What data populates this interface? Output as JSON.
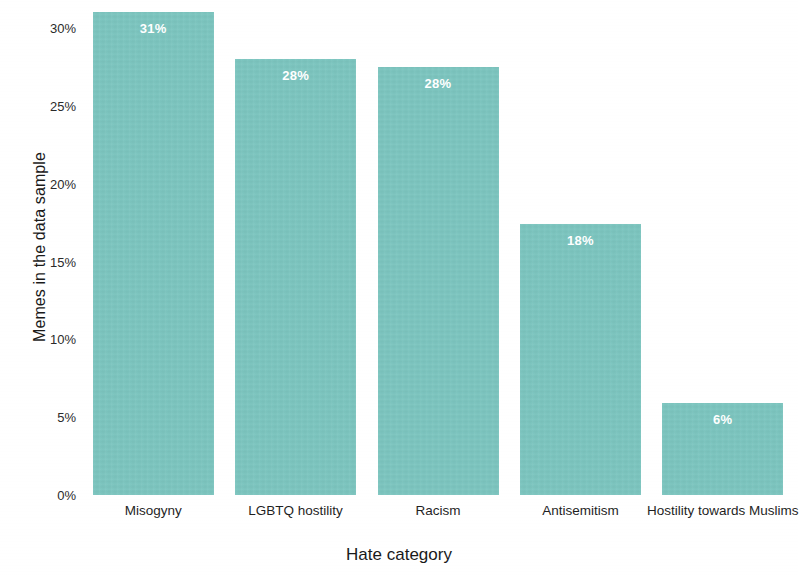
{
  "chart_data": {
    "type": "bar",
    "title": "",
    "xlabel": "Hate category",
    "ylabel": "Memes in the data sample",
    "categories": [
      "Misogyny",
      "LGBTQ hostility",
      "Racism",
      "Antisemitism",
      "Hostility towards Muslims"
    ],
    "values": [
      31,
      28,
      27.5,
      17.4,
      5.9
    ],
    "data_labels": [
      "31%",
      "28%",
      "28%",
      "18%",
      "6%"
    ],
    "ylim": [
      0,
      31.8
    ],
    "y_tick_values": [
      0,
      5,
      10,
      15,
      20,
      25,
      30
    ],
    "y_tick_labels": [
      "0%",
      "5%",
      "10%",
      "15%",
      "20%",
      "25%",
      "30%"
    ],
    "grid": false,
    "legend": false,
    "bar_color": "#7cc5bf",
    "data_label_color": "#ffffff",
    "background_color": "#ffffff"
  }
}
